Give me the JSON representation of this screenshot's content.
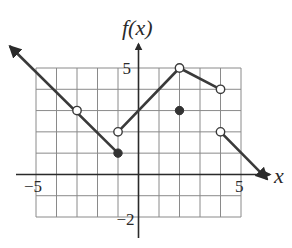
{
  "chart_data": {
    "type": "line",
    "title": "",
    "xlabel": "x",
    "ylabel": "f(x)",
    "xlim": [
      -5,
      5
    ],
    "ylim": [
      -2,
      5
    ],
    "grid": true,
    "tick_labels": {
      "x": [
        {
          "value": -5,
          "text": "−5"
        },
        {
          "value": 5,
          "text": "5"
        }
      ],
      "y": [
        {
          "value": 5,
          "text": "5"
        },
        {
          "value": -2,
          "text": "−2"
        }
      ]
    },
    "segments": [
      {
        "name": "left-ray",
        "from": [
          -6.25,
          6
        ],
        "to": [
          -1,
          1
        ],
        "arrow_start": true,
        "arrow_end": false
      },
      {
        "name": "middle-rise",
        "from": [
          -1,
          2
        ],
        "to": [
          2,
          5
        ],
        "arrow_start": false,
        "arrow_end": false
      },
      {
        "name": "middle-fall",
        "from": [
          2,
          5
        ],
        "to": [
          4,
          4
        ],
        "arrow_start": false,
        "arrow_end": false
      },
      {
        "name": "right-ray",
        "from": [
          4,
          2
        ],
        "to": [
          6.25,
          -0.2
        ],
        "arrow_start": false,
        "arrow_end": true
      }
    ],
    "points": [
      {
        "x": -3,
        "y": 3,
        "type": "open"
      },
      {
        "x": -1,
        "y": 1,
        "type": "closed"
      },
      {
        "x": -1,
        "y": 2,
        "type": "open"
      },
      {
        "x": 2,
        "y": 5,
        "type": "open"
      },
      {
        "x": 2,
        "y": 3,
        "type": "closed"
      },
      {
        "x": 4,
        "y": 4,
        "type": "open"
      },
      {
        "x": 4,
        "y": 2,
        "type": "open"
      }
    ]
  },
  "labels": {
    "y_axis": "f(x)",
    "x_axis": "x"
  }
}
